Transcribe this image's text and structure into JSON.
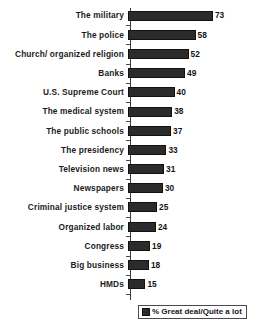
{
  "chart_data": {
    "type": "bar",
    "orientation": "horizontal",
    "title": "",
    "subtitle": "",
    "xlabel": "",
    "ylabel": "",
    "xlim": [
      0,
      73
    ],
    "grid": false,
    "legend_position": "bottom-right",
    "categories": [
      "The military",
      "The police",
      "Church/ organized religion",
      "Banks",
      "U.S. Supreme Court",
      "The medical system",
      "The public schools",
      "The presidency",
      "Television news",
      "Newspapers",
      "Criminal justice system",
      "Organized labor",
      "Congress",
      "Big business",
      "HMDs"
    ],
    "values": [
      73,
      58,
      52,
      49,
      40,
      38,
      37,
      33,
      31,
      30,
      25,
      24,
      19,
      18,
      15
    ],
    "series": [
      {
        "name": "% Great deal/Quite a lot",
        "values": [
          73,
          58,
          52,
          49,
          40,
          38,
          37,
          33,
          31,
          30,
          25,
          24,
          19,
          18,
          15
        ]
      }
    ],
    "legend": [
      "% Great deal/Quite a lot"
    ],
    "bar_color": "#2b2b2b",
    "background_color": "#ffffff"
  },
  "legend": {
    "swatch_name": "legend-swatch",
    "label": "% Great deal/Quite a lot"
  }
}
